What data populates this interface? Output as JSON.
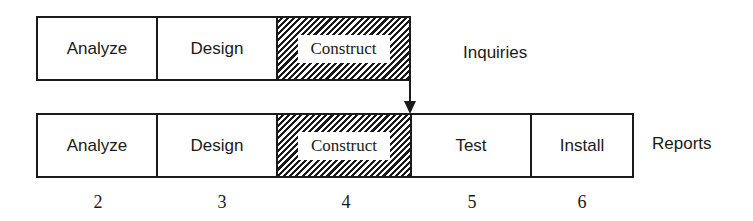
{
  "diagram": {
    "type": "phased-development-timeline",
    "rows": [
      {
        "name": "Inquiries",
        "phases": [
          {
            "label": "Analyze",
            "period": 2,
            "hatched": false
          },
          {
            "label": "Design",
            "period": 3,
            "hatched": false
          },
          {
            "label": "Construct",
            "period": 4,
            "hatched": true
          }
        ]
      },
      {
        "name": "Reports",
        "phases": [
          {
            "label": "Analyze",
            "period": 2,
            "hatched": false
          },
          {
            "label": "Design",
            "period": 3,
            "hatched": false
          },
          {
            "label": "Construct",
            "period": 4,
            "hatched": true
          },
          {
            "label": "Test",
            "period": 5,
            "hatched": false
          },
          {
            "label": "Install",
            "period": 6,
            "hatched": false
          }
        ]
      }
    ],
    "arrow": {
      "from": "Inquiries.Construct end",
      "to": "Reports.Test start"
    },
    "periods": [
      "2",
      "3",
      "4",
      "5",
      "6"
    ]
  },
  "colors": {
    "line": "#1a1a1a",
    "background": "#ffffff"
  }
}
